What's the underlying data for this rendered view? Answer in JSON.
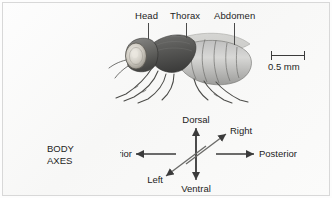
{
  "figure": {
    "kind": "anatomical-diagram",
    "background_color": "#fdfdfd",
    "line_color": "#3b3b3b",
    "text_color": "#1d1d1d"
  },
  "anatomy_labels": [
    {
      "id": "head",
      "text": "Head"
    },
    {
      "id": "thorax",
      "text": "Thorax"
    },
    {
      "id": "abdomen",
      "text": "Abdomen"
    }
  ],
  "scale": {
    "value": "0.5 mm"
  },
  "body_axes": {
    "heading_line1": "BODY",
    "heading_line2": "AXES",
    "directions": [
      {
        "id": "dorsal",
        "text": "Dorsal"
      },
      {
        "id": "ventral",
        "text": "Ventral"
      },
      {
        "id": "anterior",
        "text": "Anterior"
      },
      {
        "id": "posterior",
        "text": "Posterior"
      },
      {
        "id": "right",
        "text": "Right"
      },
      {
        "id": "left",
        "text": "Left"
      }
    ]
  }
}
